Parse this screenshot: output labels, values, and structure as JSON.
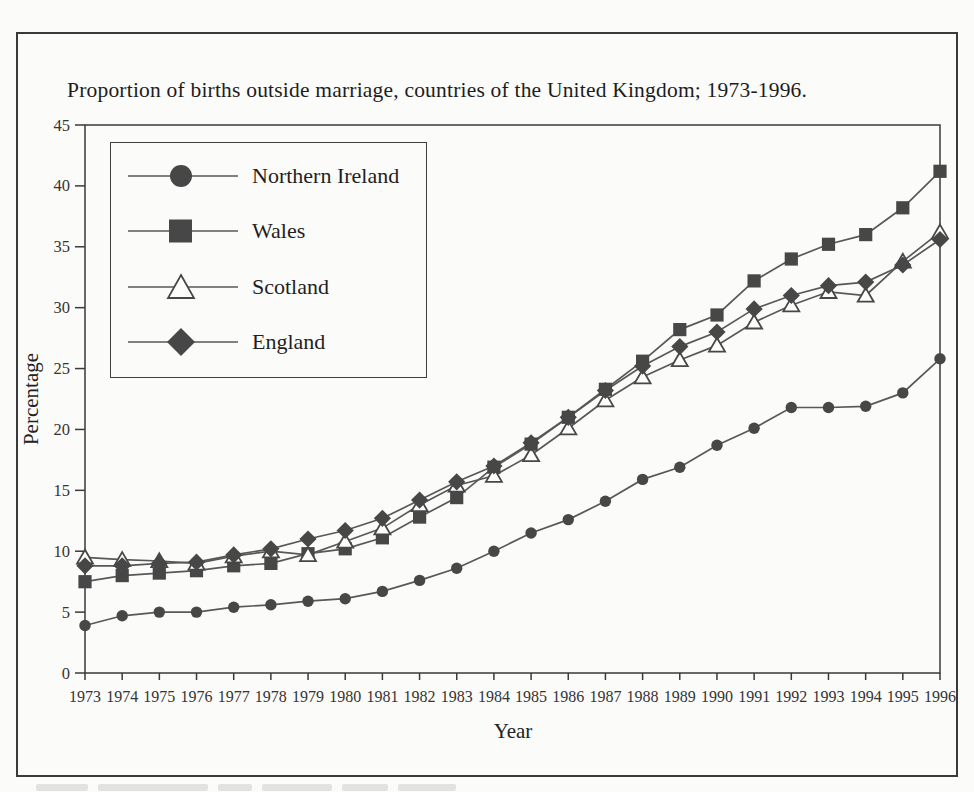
{
  "figure": {
    "title": "Proportion of births outside marriage, countries of the United Kingdom; 1973-1996."
  },
  "chart_data": {
    "type": "line",
    "title": "Proportion of births outside marriage, countries of the United Kingdom; 1973-1996.",
    "xlabel": "Year",
    "ylabel": "Percentage",
    "ylim": [
      0,
      45
    ],
    "y_ticks": [
      0,
      5,
      10,
      15,
      20,
      25,
      30,
      35,
      40,
      45
    ],
    "grid": false,
    "legend_position": "top-left",
    "x": [
      1973,
      1974,
      1975,
      1976,
      1977,
      1978,
      1979,
      1980,
      1981,
      1982,
      1983,
      1984,
      1985,
      1986,
      1987,
      1988,
      1989,
      1990,
      1991,
      1992,
      1993,
      1994,
      1995,
      1996
    ],
    "series": [
      {
        "name": "Northern Ireland",
        "marker": "circle",
        "values": [
          3.9,
          4.7,
          5.0,
          5.0,
          5.4,
          5.6,
          5.9,
          6.1,
          6.7,
          7.6,
          8.6,
          10.0,
          11.5,
          12.6,
          14.1,
          15.9,
          16.9,
          18.7,
          20.1,
          21.8,
          21.8,
          21.9,
          23.0,
          25.8
        ]
      },
      {
        "name": "Wales",
        "marker": "square",
        "values": [
          7.5,
          8.0,
          8.2,
          8.4,
          8.8,
          9.0,
          9.8,
          10.2,
          11.1,
          12.8,
          14.4,
          16.9,
          18.8,
          21.0,
          23.3,
          25.6,
          28.2,
          29.4,
          32.2,
          34.0,
          35.2,
          36.0,
          38.2,
          41.2
        ]
      },
      {
        "name": "Scotland",
        "marker": "triangle-open",
        "values": [
          9.5,
          9.3,
          9.2,
          9.0,
          9.6,
          10.0,
          9.7,
          10.8,
          11.9,
          13.8,
          15.4,
          16.2,
          17.9,
          20.1,
          22.4,
          24.3,
          25.7,
          26.9,
          28.8,
          30.2,
          31.3,
          31.0,
          33.8,
          36.2
        ]
      },
      {
        "name": "England",
        "marker": "diamond",
        "values": [
          8.8,
          8.8,
          9.0,
          9.1,
          9.7,
          10.2,
          11.0,
          11.7,
          12.7,
          14.2,
          15.7,
          17.0,
          18.9,
          21.0,
          23.2,
          25.2,
          26.8,
          28.0,
          29.9,
          31.0,
          31.8,
          32.1,
          33.5,
          35.6
        ]
      }
    ],
    "colors": {
      "axis": "#3a3a3a",
      "line": "#585858",
      "marker": "#474747",
      "open_marker_fill": "#fdfdfc",
      "text": "#343434",
      "background": "#fbfbf9"
    }
  }
}
